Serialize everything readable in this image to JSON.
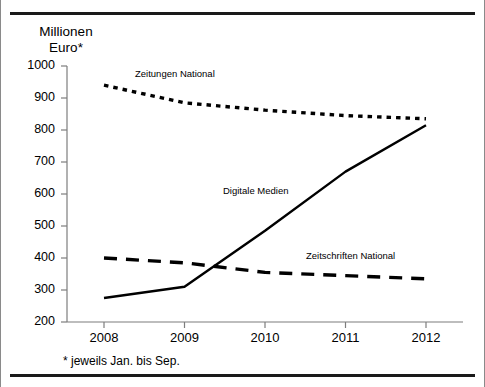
{
  "figure": {
    "axis_title": "Millionen\nEuro*",
    "footnote": "* jeweils Jan. bis Sep."
  },
  "chart_data": {
    "type": "line",
    "title": "",
    "subtitle": "",
    "xlabel": "",
    "ylabel": "Millionen Euro*",
    "categories": [
      "2008",
      "2009",
      "2010",
      "2011",
      "2012"
    ],
    "x": [
      2008,
      2009,
      2010,
      2011,
      2012
    ],
    "xlim": [
      2007.6,
      2012.2
    ],
    "ylim": [
      200,
      1000
    ],
    "yticks": [
      200,
      300,
      400,
      500,
      600,
      700,
      800,
      900,
      1000
    ],
    "ytick_labels": [
      "200",
      "300",
      "400",
      "500",
      "600",
      "700",
      "800",
      "900",
      "1000"
    ],
    "grid": false,
    "legend": "inline-annotations",
    "annotations": [
      {
        "text": "Zeitungen National",
        "series": "Zeitungen National"
      },
      {
        "text": "Digitale Medien",
        "series": "Digitale Medien"
      },
      {
        "text": "Zeitschriften National",
        "series": "Zeitschriften National"
      }
    ],
    "series": [
      {
        "name": "Zeitungen National",
        "style": "dotted",
        "color": "#000000",
        "values": [
          940,
          885,
          862,
          845,
          835
        ]
      },
      {
        "name": "Digitale Medien",
        "style": "solid",
        "color": "#000000",
        "values": [
          275,
          310,
          485,
          670,
          815
        ]
      },
      {
        "name": "Zeitschriften National",
        "style": "dashed",
        "color": "#000000",
        "values": [
          400,
          385,
          355,
          345,
          335
        ]
      }
    ]
  }
}
